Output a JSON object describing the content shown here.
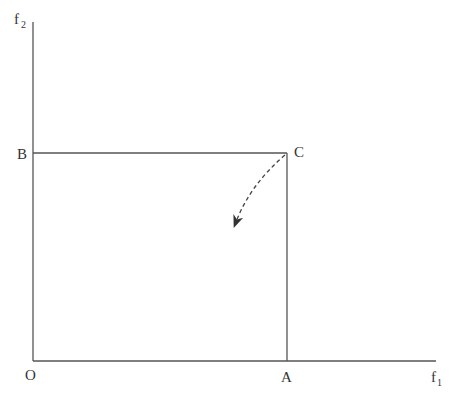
{
  "diagram": {
    "axes": {
      "y_label": "f",
      "y_label_sub": "2",
      "x_label": "f",
      "x_label_sub": "1",
      "origin_label": "O"
    },
    "points": {
      "A": "A",
      "B": "B",
      "C": "C"
    },
    "colors": {
      "line": "#555555",
      "text": "#333333"
    }
  }
}
